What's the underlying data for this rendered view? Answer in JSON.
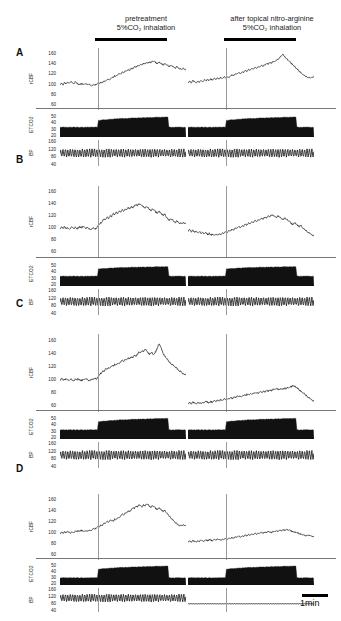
{
  "figure": {
    "title_absent": true,
    "columns": [
      {
        "id": "pretreatment",
        "line1": "pretreatment",
        "line2": "5%CO₂ inhalation"
      },
      {
        "id": "nitroarginine",
        "line1": "after topical nitro-arginine",
        "line2": "5%CO₂ inhalation"
      }
    ],
    "scale_bar": {
      "label": "1min",
      "duration_min": 1
    },
    "panel_letters": [
      "A",
      "B",
      "C",
      "D"
    ],
    "trace_labels": {
      "rcbf": "rCBF",
      "etco2": "ETCO2",
      "bp": "BP"
    },
    "axis_ticks": {
      "rcbf": [
        "160",
        "140",
        "120",
        "100",
        "80",
        "60"
      ],
      "etco2": [
        "50",
        "40",
        "30",
        "20"
      ],
      "bp": [
        "160",
        "120",
        "80",
        "40"
      ]
    },
    "colors": {
      "ink": "#000000",
      "grid": "#9a9a9a",
      "rule": "#777777"
    }
  },
  "chart_data": {
    "type": "line",
    "xlabel": "time",
    "ylabel": "rCBF (% baseline) / ETCO2 (mmHg) / BP (mmHg)",
    "legend_position": "none",
    "grid": false,
    "scale_bar_min": 1,
    "conditions": [
      "pretreatment",
      "after topical nitro-arginine"
    ],
    "subplots": [
      {
        "panel": "A",
        "rcbf": {
          "ylim": [
            50,
            170
          ],
          "yticks": [
            160,
            140,
            120,
            100,
            80,
            60
          ],
          "series": [
            {
              "name": "pretreatment",
              "co2_start_frac": 0.3,
              "values": [
                100,
                101,
                99,
                103,
                101,
                104,
                102,
                105,
                103,
                101,
                104,
                102,
                100,
                99,
                101,
                100,
                99,
                101,
                99,
                100,
                98,
                97,
                99,
                98,
                100,
                102,
                101,
                104,
                103,
                106,
                105,
                108,
                110,
                109,
                113,
                112,
                116,
                115,
                118,
                120,
                119,
                123,
                122,
                126,
                125,
                128,
                127,
                131,
                130,
                134,
                133,
                136,
                135,
                138,
                137,
                140,
                139,
                142,
                141,
                143,
                142,
                145,
                144,
                142,
                140,
                143,
                141,
                139,
                137,
                140,
                138,
                136,
                134,
                137,
                135,
                133,
                131,
                134,
                132,
                130,
                128,
                131,
                129,
                127
              ]
            },
            {
              "name": "nitroarginine",
              "co2_start_frac": 0.3,
              "values": [
                103,
                105,
                103,
                107,
                105,
                103,
                106,
                104,
                107,
                105,
                108,
                106,
                109,
                107,
                110,
                108,
                111,
                109,
                112,
                110,
                113,
                111,
                114,
                112,
                115,
                113,
                116,
                118,
                117,
                120,
                119,
                122,
                121,
                124,
                123,
                126,
                125,
                128,
                127,
                130,
                129,
                132,
                131,
                134,
                133,
                136,
                135,
                138,
                140,
                139,
                142,
                141,
                144,
                143,
                146,
                148,
                151,
                155,
                158,
                154,
                150,
                147,
                144,
                141,
                138,
                135,
                131,
                128,
                125,
                122,
                119,
                117,
                115,
                114,
                113,
                112,
                114,
                113
              ]
            }
          ]
        },
        "etco2": {
          "ylim": [
            18,
            55
          ],
          "yticks": [
            50,
            40,
            30,
            20
          ],
          "baseline": 33,
          "plateau_start": 43,
          "plateau_end": 49
        },
        "bp": {
          "ylim": [
            30,
            170
          ],
          "yticks": [
            160,
            120,
            80,
            40
          ],
          "mean": 100,
          "pulse_amplitude": 40
        }
      },
      {
        "panel": "B",
        "rcbf": {
          "ylim": [
            50,
            170
          ],
          "yticks": [
            160,
            140,
            120,
            100,
            80,
            60
          ],
          "series": [
            {
              "name": "pretreatment",
              "co2_start_frac": 0.3,
              "values": [
                99,
                101,
                100,
                102,
                99,
                101,
                98,
                100,
                102,
                99,
                101,
                98,
                100,
                102,
                100,
                103,
                101,
                99,
                101,
                99,
                97,
                99,
                100,
                98,
                100,
                104,
                106,
                109,
                112,
                115,
                113,
                118,
                116,
                121,
                119,
                124,
                122,
                126,
                124,
                128,
                126,
                130,
                128,
                132,
                130,
                134,
                132,
                136,
                134,
                137,
                139,
                138,
                140,
                139,
                137,
                135,
                133,
                136,
                134,
                131,
                129,
                132,
                130,
                127,
                125,
                128,
                126,
                123,
                121,
                124,
                118,
                115,
                113,
                116,
                114,
                111,
                109,
                112,
                110,
                108,
                107,
                109,
                108,
                107
              ]
            },
            {
              "name": "nitroarginine",
              "co2_start_frac": 0.3,
              "values": [
                95,
                97,
                94,
                96,
                93,
                95,
                92,
                94,
                91,
                93,
                90,
                92,
                89,
                91,
                88,
                90,
                87,
                89,
                88,
                90,
                89,
                92,
                91,
                94,
                93,
                96,
                95,
                98,
                97,
                100,
                99,
                102,
                101,
                104,
                103,
                106,
                105,
                108,
                107,
                110,
                109,
                112,
                111,
                114,
                113,
                116,
                115,
                118,
                117,
                120,
                119,
                122,
                121,
                119,
                117,
                120,
                118,
                116,
                114,
                117,
                115,
                113,
                111,
                108,
                106,
                109,
                107,
                104,
                102,
                105,
                100,
                98,
                96,
                94,
                92,
                90,
                88,
                87
              ]
            }
          ]
        },
        "etco2": {
          "ylim": [
            18,
            55
          ],
          "yticks": [
            50,
            40,
            30,
            20
          ],
          "baseline": 33,
          "plateau_start": 44,
          "plateau_end": 48
        },
        "bp": {
          "ylim": [
            30,
            170
          ],
          "yticks": [
            160,
            120,
            80,
            40
          ],
          "mean": 103,
          "pulse_amplitude": 42
        }
      },
      {
        "panel": "C",
        "rcbf": {
          "ylim": [
            50,
            170
          ],
          "yticks": [
            160,
            140,
            120,
            100,
            80,
            60
          ],
          "series": [
            {
              "name": "pretreatment",
              "co2_start_frac": 0.3,
              "values": [
                99,
                101,
                100,
                99,
                101,
                100,
                99,
                101,
                99,
                98,
                100,
                99,
                101,
                99,
                98,
                100,
                99,
                101,
                100,
                98,
                99,
                101,
                100,
                102,
                101,
                104,
                107,
                110,
                113,
                112,
                116,
                115,
                119,
                118,
                121,
                120,
                123,
                122,
                125,
                124,
                127,
                129,
                128,
                131,
                130,
                133,
                132,
                135,
                134,
                137,
                136,
                139,
                142,
                141,
                144,
                143,
                146,
                145,
                141,
                139,
                142,
                140,
                138,
                143,
                148,
                155,
                152,
                146,
                140,
                136,
                133,
                130,
                127,
                125,
                123,
                121,
                119,
                117,
                115,
                113,
                111,
                109,
                108,
                107
              ]
            },
            {
              "name": "nitroarginine",
              "co2_start_frac": 0.3,
              "values": [
                63,
                64,
                63,
                65,
                64,
                63,
                65,
                64,
                63,
                65,
                64,
                66,
                65,
                64,
                66,
                65,
                67,
                66,
                68,
                67,
                69,
                68,
                70,
                69,
                71,
                70,
                72,
                71,
                73,
                72,
                74,
                73,
                75,
                74,
                76,
                75,
                77,
                76,
                78,
                77,
                79,
                78,
                80,
                79,
                81,
                80,
                82,
                81,
                83,
                82,
                84,
                83,
                85,
                84,
                86,
                85,
                84,
                86,
                85,
                87,
                86,
                88,
                87,
                89,
                91,
                90,
                88,
                86,
                84,
                82,
                80,
                78,
                76,
                74,
                72,
                70,
                68,
                66
              ]
            }
          ]
        },
        "etco2": {
          "ylim": [
            18,
            55
          ],
          "yticks": [
            50,
            40,
            30,
            20
          ],
          "baseline": 32,
          "plateau_start": 44,
          "plateau_end": 50
        },
        "bp": {
          "ylim": [
            30,
            170
          ],
          "yticks": [
            160,
            120,
            80,
            40
          ],
          "mean": 100,
          "pulse_amplitude": 44
        }
      },
      {
        "panel": "D",
        "rcbf": {
          "ylim": [
            50,
            170
          ],
          "yticks": [
            160,
            140,
            120,
            100,
            80,
            60
          ],
          "series": [
            {
              "name": "pretreatment",
              "co2_start_frac": 0.3,
              "values": [
                98,
                100,
                99,
                101,
                100,
                102,
                101,
                99,
                101,
                100,
                102,
                101,
                103,
                102,
                104,
                103,
                101,
                103,
                102,
                104,
                103,
                105,
                107,
                106,
                109,
                111,
                110,
                114,
                113,
                117,
                116,
                120,
                119,
                123,
                122,
                120,
                124,
                123,
                127,
                126,
                130,
                133,
                132,
                136,
                135,
                139,
                138,
                142,
                145,
                144,
                148,
                147,
                150,
                149,
                146,
                150,
                148,
                152,
                151,
                148,
                146,
                149,
                147,
                144,
                142,
                145,
                143,
                140,
                138,
                141,
                136,
                133,
                130,
                127,
                124,
                121,
                118,
                116,
                114,
                113,
                112,
                114,
                113,
                112
              ]
            },
            {
              "name": "nitroarginine",
              "co2_start_frac": 0.3,
              "values": [
                83,
                84,
                83,
                85,
                84,
                83,
                85,
                84,
                86,
                85,
                84,
                86,
                85,
                87,
                86,
                85,
                87,
                86,
                88,
                87,
                86,
                88,
                87,
                89,
                88,
                90,
                89,
                91,
                90,
                92,
                91,
                93,
                92,
                94,
                93,
                95,
                94,
                96,
                95,
                97,
                96,
                98,
                97,
                99,
                98,
                100,
                99,
                101,
                100,
                102,
                101,
                100,
                102,
                101,
                103,
                102,
                104,
                103,
                105,
                104,
                106,
                105,
                104,
                103,
                102,
                101,
                100,
                99,
                98,
                97,
                96,
                95,
                94,
                96,
                95,
                94,
                93,
                92
              ]
            }
          ]
        },
        "etco2": {
          "ylim": [
            18,
            55
          ],
          "yticks": [
            50,
            40,
            30,
            20
          ],
          "baseline": 30,
          "plateau_start": 44,
          "plateau_end": 50
        },
        "bp": {
          "ylim": [
            30,
            170
          ],
          "yticks": [
            160,
            120,
            80,
            40
          ],
          "mean_pre": 112,
          "pulse_amplitude_pre": 40,
          "mean_post": 78,
          "pulse_amplitude_post": 2,
          "note": "flat low BP after nitro-arginine"
        }
      }
    ]
  }
}
